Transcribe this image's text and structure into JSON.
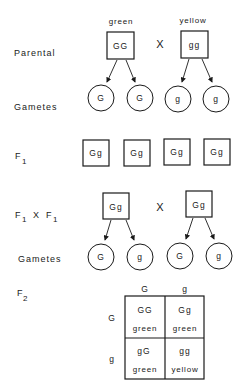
{
  "rows": {
    "parental": "Parental",
    "gametes1": "Gametes",
    "f1_main": "F",
    "f1_sub": "1",
    "f1xf1_a": "F",
    "f1xf1_a_sub": "1",
    "f1xf1_x": "X",
    "f1xf1_b": "F",
    "f1xf1_b_sub": "1",
    "gametes2": "Gametes",
    "f2_main": "F",
    "f2_sub": "2"
  },
  "parental": {
    "left": {
      "phenotype": "green",
      "genotype": "GG"
    },
    "cross": "X",
    "right": {
      "phenotype": "yellow",
      "genotype": "gg"
    },
    "gametes": [
      "G",
      "G",
      "g",
      "g"
    ]
  },
  "f1": {
    "offspring": [
      "Gg",
      "Gg",
      "Gg",
      "Gg"
    ]
  },
  "f1_cross": {
    "left": {
      "genotype": "Gg"
    },
    "cross": "X",
    "right": {
      "genotype": "Gg"
    },
    "gametes": [
      "G",
      "g",
      "G",
      "g"
    ]
  },
  "punnett": {
    "col_headers": [
      "G",
      "g"
    ],
    "row_headers": [
      "G",
      "g"
    ],
    "cells": [
      [
        {
          "genotype": "GG",
          "phenotype": "green"
        },
        {
          "genotype": "Gg",
          "phenotype": "green"
        }
      ],
      [
        {
          "genotype": "gG",
          "phenotype": "green"
        },
        {
          "genotype": "gg",
          "phenotype": "yellow"
        }
      ]
    ]
  }
}
